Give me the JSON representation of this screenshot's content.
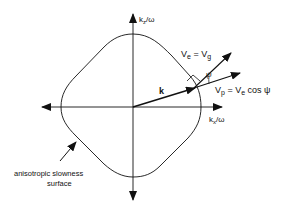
{
  "diagram": {
    "axes": {
      "vertical_label": "k",
      "vertical_sub": "z",
      "vertical_suffix": "/ω",
      "horizontal_label": "k",
      "horizontal_sub": "x",
      "horizontal_suffix": "/ω"
    },
    "vectors": {
      "k_label": "k",
      "ve_label_main": "V",
      "ve_label_sub": "e",
      "ve_label_eq": " = V",
      "ve_label_sub2": "g",
      "psi_label": "ψ",
      "vp_label_main": "V",
      "vp_label_sub": "p",
      "vp_label_eq": " = V",
      "vp_label_sub2": "e",
      "vp_label_tail": " cos ψ"
    },
    "annotation": {
      "line1": "anisotropic slowness",
      "line2": "surface"
    },
    "colors": {
      "stroke": "#111111",
      "background": "#ffffff"
    }
  }
}
